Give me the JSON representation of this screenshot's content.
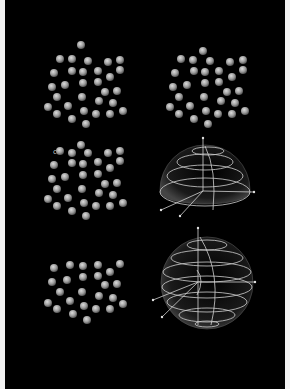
{
  "figure": {
    "background": "#000000",
    "border_color": "#f2f2f2",
    "sphere_color": "#a8a8a8",
    "sphere_highlight": "#d8d8d8",
    "wire_color": "#d0d0d0",
    "panels": [
      {
        "id": "a",
        "type": "sphere-cluster",
        "row": 1,
        "col": 1,
        "marker": "",
        "sphere_count": 31
      },
      {
        "id": "b",
        "type": "sphere-cluster",
        "row": 1,
        "col": 2,
        "marker": "",
        "sphere_count": 31
      },
      {
        "id": "c",
        "type": "sphere-cluster",
        "row": 2,
        "col": 1,
        "marker": "c",
        "sphere_count": 31
      },
      {
        "id": "d",
        "type": "hemisphere-spiral",
        "row": 2,
        "col": 2
      },
      {
        "id": "e",
        "type": "sphere-cluster",
        "row": 3,
        "col": 1,
        "marker": "",
        "sphere_count": 31
      },
      {
        "id": "f",
        "type": "sphere-spiral",
        "row": 3,
        "col": 2
      }
    ]
  }
}
